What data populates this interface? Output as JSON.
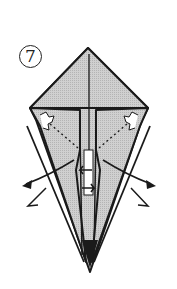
{
  "diagram": {
    "type": "origami-fold-step",
    "step_number": "7",
    "step_label": "⑦",
    "colors": {
      "paper": "#c8c8c8",
      "outline": "#1a1a1a",
      "background": "#ffffff"
    },
    "elements": [
      "top-triangle-flap",
      "center-crease",
      "left-side-flap",
      "right-side-flap",
      "left-dotted-fold-line",
      "right-dotted-fold-line",
      "left-pull-arrow",
      "right-pull-arrow",
      "center-open-arrows",
      "bottom-point"
    ]
  }
}
